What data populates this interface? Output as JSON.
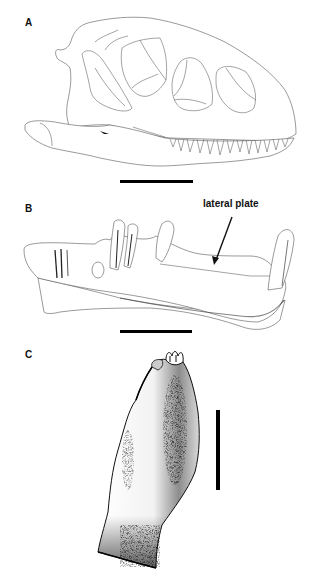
{
  "figure": {
    "panels": [
      {
        "id": "A",
        "label": "A",
        "subject": "skull in lateral view",
        "scale_bar": "horizontal"
      },
      {
        "id": "B",
        "label": "B",
        "subject": "lower jaw fragment with teeth in lateral view",
        "annotation": "lateral plate",
        "scale_bar": "horizontal"
      },
      {
        "id": "C",
        "label": "C",
        "subject": "isolated tooth",
        "scale_bar": "vertical"
      }
    ]
  }
}
